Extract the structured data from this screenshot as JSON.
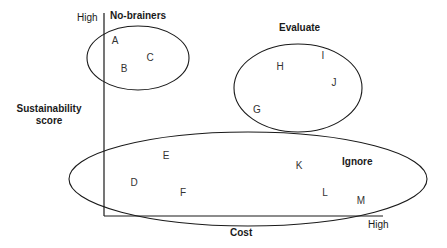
{
  "diagram": {
    "type": "quadrant-matrix",
    "axes": {
      "x": {
        "title": "Cost",
        "high_label": "High"
      },
      "y": {
        "title": "Sustainability score",
        "title_lines": [
          "Sustainability",
          "score"
        ],
        "high_label": "High"
      }
    },
    "groups": [
      {
        "id": "no-brainers",
        "label": "No-brainers",
        "members": [
          "A",
          "B",
          "C"
        ]
      },
      {
        "id": "evaluate",
        "label": "Evaluate",
        "members": [
          "G",
          "H",
          "I",
          "J"
        ]
      },
      {
        "id": "ignore",
        "label": "Ignore",
        "members": [
          "D",
          "E",
          "F",
          "K",
          "L",
          "M"
        ]
      }
    ],
    "points": {
      "A": "A",
      "B": "B",
      "C": "C",
      "D": "D",
      "E": "E",
      "F": "F",
      "G": "G",
      "H": "H",
      "I": "I",
      "J": "J",
      "K": "K",
      "L": "L",
      "M": "M"
    },
    "colors": {
      "stroke": "#1a1a1a",
      "text": "#333333"
    }
  }
}
